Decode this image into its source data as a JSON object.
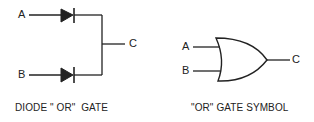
{
  "diode_or_gate": {
    "caption": "DIODE \" OR\"  GATE",
    "inputs": [
      {
        "label": "A"
      },
      {
        "label": "B"
      }
    ],
    "output": {
      "label": "C"
    },
    "components": [
      "diode",
      "diode"
    ]
  },
  "or_gate_symbol": {
    "caption": "\"OR\" GATE SYMBOL",
    "inputs": [
      {
        "label": "A"
      },
      {
        "label": "B"
      }
    ],
    "output": {
      "label": "C"
    }
  },
  "colors": {
    "stroke": "#222222",
    "background": "#ffffff"
  }
}
